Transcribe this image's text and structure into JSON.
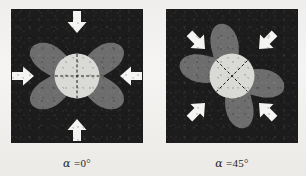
{
  "figure": {
    "background_color": "#f1efed",
    "panel_background_color": "#1c1c1c",
    "lobe_color": "#6d6d6d",
    "inclusion_color": "#d9d9d6",
    "arrow_color": "#f4f4f2",
    "dashed_line_color": "#1a1a1a"
  },
  "panels": [
    {
      "id": "panel-alpha-0",
      "caption": "α =0°",
      "caption_symbol": "α",
      "caption_value": "=0°",
      "angle_deg": 0,
      "shape_rotation_deg": 0,
      "inclusion_marker": "cross",
      "arrow_count": 4,
      "arrows": [
        {
          "name": "arrow-top",
          "direction": "down",
          "angle_deg": 90,
          "x": 66,
          "y": 20
        },
        {
          "name": "arrow-bottom",
          "direction": "up",
          "angle_deg": 270,
          "x": 66,
          "y": 114
        },
        {
          "name": "arrow-left",
          "direction": "right",
          "angle_deg": 0,
          "x": 18,
          "y": 67
        },
        {
          "name": "arrow-right",
          "direction": "left",
          "angle_deg": 180,
          "x": 114,
          "y": 67
        }
      ]
    },
    {
      "id": "panel-alpha-45",
      "caption": "α =45°",
      "caption_symbol": "α",
      "caption_value": "=45°",
      "angle_deg": 45,
      "shape_rotation_deg": 45,
      "inclusion_marker": "diagonal-cross",
      "arrow_count": 4,
      "arrows": [
        {
          "name": "arrow-top-left",
          "direction": "down-right",
          "angle_deg": 45,
          "x": 26,
          "y": 27
        },
        {
          "name": "arrow-top-right",
          "direction": "down-left",
          "angle_deg": 135,
          "x": 106,
          "y": 27
        },
        {
          "name": "arrow-bottom-left",
          "direction": "up-right",
          "angle_deg": 315,
          "x": 26,
          "y": 107
        },
        {
          "name": "arrow-bottom-right",
          "direction": "up-left",
          "angle_deg": 225,
          "x": 106,
          "y": 107
        }
      ]
    }
  ]
}
